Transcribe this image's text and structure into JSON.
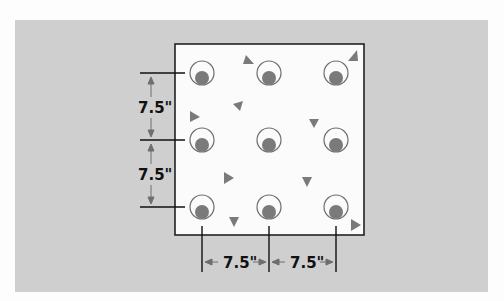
{
  "diagram": {
    "grid": {
      "rows": 3,
      "cols": 3,
      "spacing_label": "7.5\""
    },
    "dimensions": {
      "vertical": [
        "7.5\"",
        "7.5\""
      ],
      "horizontal": [
        "7.5\"",
        "7.5\""
      ]
    },
    "colors": {
      "background": "#cfcfcf",
      "square_fill": "#fbfbfb",
      "outline": "#222222",
      "circle_stroke": "#6e6e6e",
      "dot_fill": "#7a7a7a",
      "triangle_fill": "#7a7a7a"
    }
  }
}
